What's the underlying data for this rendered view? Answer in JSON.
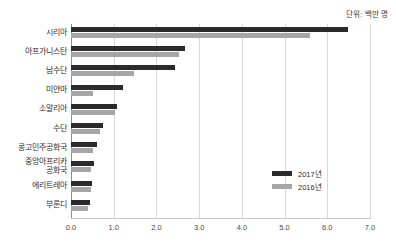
{
  "chart_data": {
    "type": "bar",
    "orientation": "horizontal",
    "title": "",
    "subtitle": "",
    "unit_note": "단위: 백만 명",
    "xlabel": "",
    "ylabel": "",
    "xlim": [
      0.0,
      7.0
    ],
    "xticks": [
      "0.0",
      "1.0",
      "2.0",
      "3.0",
      "4.0",
      "5.0",
      "6.0",
      "7.0"
    ],
    "xtick_values": [
      0.0,
      1.0,
      2.0,
      3.0,
      4.0,
      5.0,
      6.0,
      7.0
    ],
    "grid": true,
    "grid_axis": "x",
    "legend_position": "middle-right",
    "categories": [
      "시리아",
      "아프가니스탄",
      "남수단",
      "미얀마",
      "소말리아",
      "수단",
      "콩고민주공화국",
      "중앙아프리카\n공화국",
      "에리트레아",
      "부룬디"
    ],
    "series": [
      {
        "name": "2017년",
        "color": "#2b2b2b",
        "values": [
          6.49,
          2.67,
          2.44,
          1.22,
          1.07,
          0.74,
          0.62,
          0.55,
          0.49,
          0.44
        ]
      },
      {
        "name": "2016년",
        "color": "#a6a6a6",
        "values": [
          5.6,
          2.53,
          1.47,
          0.52,
          1.03,
          0.68,
          0.52,
          0.46,
          0.46,
          0.39
        ]
      }
    ]
  },
  "colors": {
    "series_2017": "#2b2b2b",
    "series_2016": "#a6a6a6",
    "gridline": "#d9d9d9",
    "axis": "#8c8c8c",
    "background": "#ffffff",
    "text": "#2f2f2f"
  }
}
